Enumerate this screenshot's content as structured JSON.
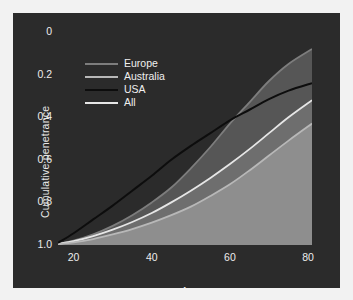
{
  "figure": {
    "background": "#ffffff",
    "panel_color": "#2b2b2b",
    "width": 353,
    "height": 300
  },
  "axes": {
    "xlabel": "Age",
    "ylabel": "Cumulative penetrance",
    "xticks": [
      "20",
      "40",
      "60",
      "80"
    ],
    "yticks": [
      "1.0",
      "0.8",
      "0.6",
      "0.4",
      "0.2",
      "0"
    ]
  },
  "legend": {
    "items": [
      {
        "label": "Europe",
        "color": "#7d7d7d"
      },
      {
        "label": "Australia",
        "color": "#b8b8b8"
      },
      {
        "label": "USA",
        "color": "#0d0d0d"
      },
      {
        "label": "All",
        "color": "#e6e6e6"
      }
    ]
  },
  "chart_data": {
    "type": "line",
    "title": "",
    "xlabel": "Age",
    "ylabel": "Cumulative penetrance",
    "xlim": [
      16,
      81
    ],
    "ylim": [
      0,
      1.0
    ],
    "xticks": [
      20,
      40,
      60,
      80
    ],
    "yticks": [
      0,
      0.2,
      0.4,
      0.6,
      0.8,
      1.0
    ],
    "grid": false,
    "legend_position": "upper left",
    "filled": true,
    "x": [
      16,
      20,
      25,
      30,
      35,
      40,
      45,
      50,
      55,
      60,
      65,
      70,
      75,
      81
    ],
    "series": [
      {
        "name": "Europe",
        "color": "#7d7d7d",
        "fill_color": "#565656",
        "values": [
          0.005,
          0.02,
          0.05,
          0.09,
          0.14,
          0.2,
          0.27,
          0.36,
          0.46,
          0.57,
          0.67,
          0.77,
          0.85,
          0.92
        ]
      },
      {
        "name": "Australia",
        "color": "#b8b8b8",
        "fill_color": "#8e8e8e",
        "values": [
          0.004,
          0.012,
          0.028,
          0.05,
          0.075,
          0.105,
          0.14,
          0.18,
          0.23,
          0.285,
          0.35,
          0.42,
          0.49,
          0.57
        ]
      },
      {
        "name": "USA",
        "color": "#0d0d0d",
        "fill_color": "none",
        "values": [
          0.01,
          0.055,
          0.12,
          0.185,
          0.255,
          0.325,
          0.4,
          0.465,
          0.525,
          0.585,
          0.635,
          0.685,
          0.725,
          0.76
        ]
      },
      {
        "name": "All",
        "color": "#e6e6e6",
        "fill_color": "#6e6e6e",
        "values": [
          0.005,
          0.018,
          0.042,
          0.072,
          0.108,
          0.15,
          0.2,
          0.255,
          0.315,
          0.38,
          0.45,
          0.525,
          0.6,
          0.68
        ]
      }
    ],
    "annotations": [
      "Europe curve crosses USA curve at approximately age 64",
      "Europe reaches the highest cumulative penetrance (~0.92) at age 81",
      "Australia remains lowest across the full age range (~0.57 at age 81)"
    ]
  }
}
